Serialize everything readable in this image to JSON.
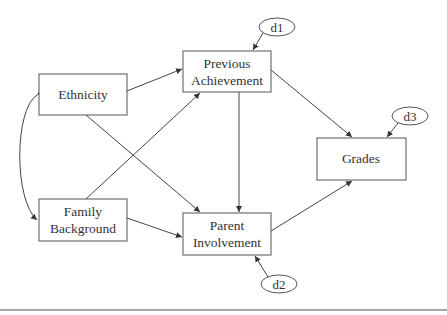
{
  "diagram": {
    "type": "path-model",
    "nodes": [
      {
        "id": "ethnicity",
        "label_lines": [
          "Ethnicity"
        ]
      },
      {
        "id": "family_background",
        "label_lines": [
          "Family",
          "Background"
        ]
      },
      {
        "id": "previous_achievement",
        "label_lines": [
          "Previous",
          "Achievement"
        ]
      },
      {
        "id": "parent_involvement",
        "label_lines": [
          "Parent",
          "Involvement"
        ]
      },
      {
        "id": "grades",
        "label_lines": [
          "Grades"
        ]
      }
    ],
    "disturbances": [
      {
        "id": "d1",
        "label": "d1",
        "target": "previous_achievement"
      },
      {
        "id": "d2",
        "label": "d2",
        "target": "parent_involvement"
      },
      {
        "id": "d3",
        "label": "d3",
        "target": "grades"
      }
    ],
    "edges": [
      {
        "from": "ethnicity",
        "to": "previous_achievement"
      },
      {
        "from": "ethnicity",
        "to": "parent_involvement"
      },
      {
        "from": "family_background",
        "to": "previous_achievement"
      },
      {
        "from": "family_background",
        "to": "parent_involvement"
      },
      {
        "from": "previous_achievement",
        "to": "parent_involvement"
      },
      {
        "from": "previous_achievement",
        "to": "grades"
      },
      {
        "from": "parent_involvement",
        "to": "grades"
      },
      {
        "from": "d1",
        "to": "previous_achievement"
      },
      {
        "from": "d2",
        "to": "parent_involvement"
      },
      {
        "from": "d3",
        "to": "grades"
      }
    ],
    "correlations": [
      {
        "between": [
          "ethnicity",
          "family_background"
        ],
        "style": "curved-double-arrow"
      }
    ]
  }
}
